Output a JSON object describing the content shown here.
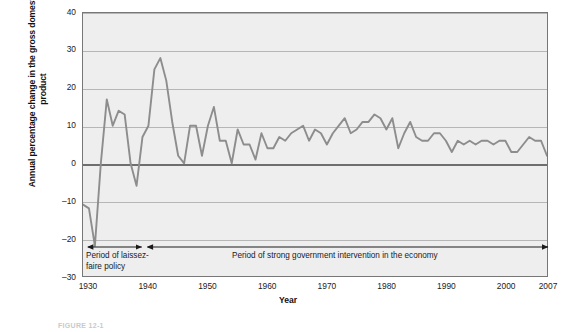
{
  "chart_data": {
    "type": "line",
    "title": "",
    "xlabel": "Year",
    "ylabel": "Annual percentage change in\nthe gross domestic product",
    "xlim": [
      1929,
      2007
    ],
    "ylim": [
      -30,
      40
    ],
    "y_ticks": [
      40,
      30,
      20,
      10,
      0,
      -10,
      -20,
      -30
    ],
    "y_tick_labels": [
      "40",
      "30",
      "20",
      "10",
      "0",
      "–10",
      "–20",
      "–30"
    ],
    "x_ticks": [
      1930,
      1940,
      1950,
      1960,
      1970,
      1980,
      1990,
      2000,
      2007
    ],
    "x_tick_labels": [
      "1930",
      "1940",
      "1950",
      "1960",
      "1970",
      "1980",
      "1990",
      "2000",
      "2007"
    ],
    "grid": true,
    "legend": "none",
    "line_color": "#8d8d8d",
    "plot_bg_color": "#eeeeee",
    "zero_line_color": "#6e6e6e",
    "series": [
      {
        "name": "Annual percentage change in GDP",
        "x": [
          1929,
          1930,
          1931,
          1932,
          1933,
          1934,
          1935,
          1936,
          1937,
          1938,
          1939,
          1940,
          1941,
          1942,
          1943,
          1944,
          1945,
          1946,
          1947,
          1948,
          1949,
          1950,
          1951,
          1952,
          1953,
          1954,
          1955,
          1956,
          1957,
          1958,
          1959,
          1960,
          1961,
          1962,
          1963,
          1964,
          1965,
          1966,
          1967,
          1968,
          1969,
          1970,
          1971,
          1972,
          1973,
          1974,
          1975,
          1976,
          1977,
          1978,
          1979,
          1980,
          1981,
          1982,
          1983,
          1984,
          1985,
          1986,
          1987,
          1988,
          1989,
          1990,
          1991,
          1992,
          1993,
          1994,
          1995,
          1996,
          1997,
          1998,
          1999,
          2000,
          2001,
          2002,
          2003,
          2004,
          2005,
          2006,
          2007
        ],
        "values": [
          -11,
          -12,
          -22,
          0,
          17,
          10,
          14,
          13,
          0,
          -6,
          7,
          10,
          25,
          28,
          22,
          11,
          2,
          0,
          10,
          10,
          2,
          10,
          15,
          6,
          6,
          0,
          9,
          5,
          5,
          1,
          8,
          4,
          4,
          7,
          6,
          8,
          9,
          10,
          6,
          9,
          8,
          5,
          8,
          10,
          12,
          8,
          9,
          11,
          11,
          13,
          12,
          9,
          12,
          4,
          8,
          11,
          7,
          6,
          6,
          8,
          8,
          6,
          3,
          6,
          5,
          6,
          5,
          6,
          6,
          5,
          6,
          6,
          3,
          3,
          5,
          7,
          6,
          6,
          2
        ]
      }
    ],
    "annotations": [
      {
        "id": "laissez-faire",
        "label": "Period of laissez-\nfaire policy",
        "arrow_style": "double",
        "x_start": 1930,
        "x_end": 1939
      },
      {
        "id": "government-intervention",
        "label": "Period of strong government intervention in the economy",
        "arrow_style": "double",
        "x_start": 1940,
        "x_end": 2007
      }
    ]
  },
  "caption": {
    "text": "FIGURE 12-1"
  }
}
